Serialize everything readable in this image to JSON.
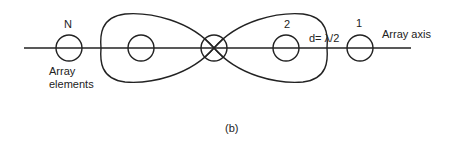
{
  "figure": {
    "panel_label": "(b)",
    "labels": {
      "element_N": "N",
      "element_2": "2",
      "element_1": "1",
      "spacing": "d= λ/2",
      "axis": "Array axis",
      "elements_line1": "Array",
      "elements_line2": "elements"
    },
    "colors": {
      "ink": "#222222",
      "background": "#ffffff"
    }
  }
}
